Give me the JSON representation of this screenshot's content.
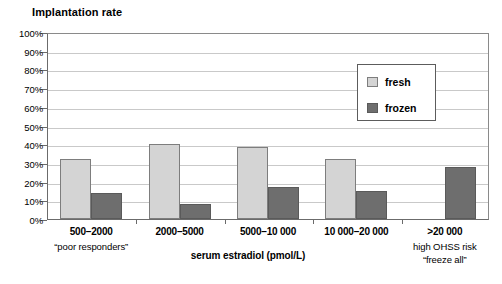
{
  "chart_data": {
    "type": "bar",
    "title": "Implantation rate",
    "xlabel": "serum estradiol (pmol/L)",
    "ylabel": "",
    "ylim": [
      0,
      100
    ],
    "yticks": [
      "0%",
      "10%",
      "20%",
      "30%",
      "40%",
      "50%",
      "60%",
      "70%",
      "80%",
      "90%",
      "100%"
    ],
    "ytick_values": [
      0,
      10,
      20,
      30,
      40,
      50,
      60,
      70,
      80,
      90,
      100
    ],
    "grid": true,
    "legend_position": "upper right",
    "categories": [
      "500–2000",
      "2000–5000",
      "5000–10 000",
      "10 000–20 000",
      ">20 000"
    ],
    "category_sublabels": [
      [
        "“poor responders”"
      ],
      [],
      [],
      [],
      [
        "high OHSS risk",
        "“freeze all”"
      ]
    ],
    "series": [
      {
        "name": "fresh",
        "color": "#d4d4d4",
        "values": [
          32,
          40,
          38.5,
          32,
          null
        ]
      },
      {
        "name": "frozen",
        "color": "#6e6e6e",
        "values": [
          14,
          8,
          17,
          15,
          28
        ]
      }
    ]
  },
  "legend": {
    "items": [
      {
        "label": "fresh",
        "swatch": "fresh"
      },
      {
        "label": "frozen",
        "swatch": "frozen"
      }
    ]
  }
}
